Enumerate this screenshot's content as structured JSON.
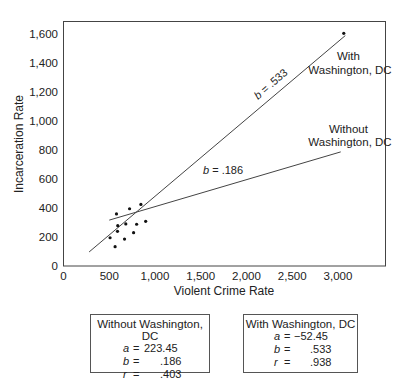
{
  "chart_data": {
    "type": "scatter",
    "title": "",
    "xlabel": "Violent Crime Rate",
    "ylabel": "Incarceration Rate",
    "xlim": [
      0,
      3500
    ],
    "ylim": [
      0,
      1700
    ],
    "xticks": [
      0,
      500,
      1000,
      1500,
      2000,
      2500,
      3000
    ],
    "xtick_labels": [
      "0",
      "500",
      "1,000",
      "1,500",
      "2,000",
      "2,500",
      "3,000"
    ],
    "yticks": [
      0,
      200,
      400,
      600,
      800,
      1000,
      1200,
      1400,
      1600
    ],
    "ytick_labels": [
      "0",
      "200",
      "400",
      "600",
      "800",
      "1,000",
      "1,200",
      "1,400",
      "1,600"
    ],
    "grid": false,
    "points": [
      {
        "x": 579,
        "y": 359
      },
      {
        "x": 722,
        "y": 395
      },
      {
        "x": 846,
        "y": 425
      },
      {
        "x": 898,
        "y": 308
      },
      {
        "x": 593,
        "y": 278
      },
      {
        "x": 681,
        "y": 290
      },
      {
        "x": 799,
        "y": 288
      },
      {
        "x": 590,
        "y": 239
      },
      {
        "x": 766,
        "y": 230
      },
      {
        "x": 509,
        "y": 195
      },
      {
        "x": 667,
        "y": 186
      },
      {
        "x": 564,
        "y": 133
      },
      {
        "x": 3063,
        "y": 1605,
        "label": "Washington, DC"
      }
    ],
    "regression_lines": [
      {
        "name": "With Washington, DC",
        "a": -52.45,
        "b": 0.533,
        "r": 0.938,
        "x_start": 280,
        "x_end": 3080,
        "label": "b = .533"
      },
      {
        "name": "Without Washington, DC",
        "a": 223.45,
        "b": 0.186,
        "r": 0.403,
        "x_start": 500,
        "x_end": 3030,
        "label": "b = .186"
      }
    ],
    "annotations": [
      {
        "text": "With Washington, DC",
        "x": 3300,
        "y": 1320
      },
      {
        "text": "Without Washington, DC",
        "x": 3300,
        "y": 960
      },
      {
        "text": "b = .533",
        "x": 2300,
        "y": 1200
      },
      {
        "text": "b = .186",
        "x": 1300,
        "y": 670
      }
    ]
  },
  "labels": {
    "with_dc_line1": "With",
    "with_dc_line2": "Washington, DC",
    "without_dc_line1": "Without",
    "without_dc_line2": "Washington, DC",
    "slope_with": ".533",
    "slope_without": ".186",
    "b_var": "b",
    "eq": " = "
  },
  "stat_boxes": [
    {
      "title": "Without Washington, DC",
      "rows": [
        {
          "var": "a",
          "eq": "=",
          "val": "223.45"
        },
        {
          "var": "b",
          "eq": "=",
          "val": ".186"
        },
        {
          "var": "r",
          "eq": "=",
          "val": ".403"
        }
      ]
    },
    {
      "title": "With Washington, DC",
      "rows": [
        {
          "var": "a",
          "eq": "=",
          "val": "−52.45"
        },
        {
          "var": "b",
          "eq": "=",
          "val": ".533"
        },
        {
          "var": "r",
          "eq": "=",
          "val": ".938"
        }
      ]
    }
  ]
}
